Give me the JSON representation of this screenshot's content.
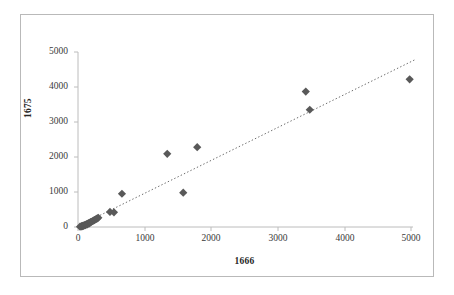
{
  "chart_data": {
    "type": "scatter",
    "title": "",
    "xlabel": "1666",
    "ylabel": "1675",
    "xlim": [
      0,
      5000
    ],
    "ylim": [
      0,
      5000
    ],
    "xticks": [
      0,
      1000,
      2000,
      3000,
      4000,
      5000
    ],
    "yticks": [
      0,
      1000,
      2000,
      3000,
      4000,
      5000
    ],
    "xtick_labels": [
      "0",
      "1000",
      "2000",
      "3000",
      "4000",
      "5000"
    ],
    "ytick_labels": [
      "0",
      "1000",
      "2000",
      "3000",
      "4000",
      "5000"
    ],
    "grid": false,
    "legend": false,
    "legend_position": "none",
    "marker": "diamond",
    "marker_color": "#595959",
    "marker_size": 7,
    "series": [
      {
        "name": "1675 vs 1666",
        "points": [
          [
            30,
            10
          ],
          [
            45,
            15
          ],
          [
            55,
            25
          ],
          [
            60,
            20
          ],
          [
            70,
            35
          ],
          [
            80,
            30
          ],
          [
            90,
            45
          ],
          [
            100,
            55
          ],
          [
            110,
            50
          ],
          [
            120,
            70
          ],
          [
            130,
            80
          ],
          [
            140,
            75
          ],
          [
            150,
            95
          ],
          [
            160,
            110
          ],
          [
            170,
            105
          ],
          [
            180,
            125
          ],
          [
            190,
            140
          ],
          [
            200,
            150
          ],
          [
            215,
            165
          ],
          [
            230,
            180
          ],
          [
            245,
            195
          ],
          [
            260,
            215
          ],
          [
            275,
            230
          ],
          [
            290,
            245
          ],
          [
            305,
            265
          ],
          [
            480,
            430
          ],
          [
            540,
            420
          ],
          [
            660,
            950
          ],
          [
            1340,
            2090
          ],
          [
            1580,
            980
          ],
          [
            1790,
            2280
          ],
          [
            3420,
            3870
          ],
          [
            3480,
            3350
          ],
          [
            4980,
            4220
          ]
        ]
      }
    ],
    "trendline": {
      "style": "dotted",
      "color": "#6b6b6b",
      "x_start": 40,
      "y_start": 60,
      "x_end": 5060,
      "y_end": 4780
    }
  },
  "axes": {
    "y_title": "1675",
    "x_title": "1666"
  }
}
